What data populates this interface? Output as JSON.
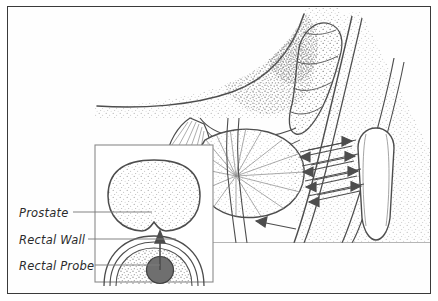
{
  "figure": {
    "kind": "medical-illustration",
    "background_color": "#ffffff",
    "border_color": "#3a3a3a",
    "ink_color": "#4a4a4a",
    "stipple_color": "#8c8c8c",
    "probe_fill_color": "#6f6f6f",
    "leader_color": "#7d7d7d"
  },
  "labels": {
    "prostate": "Prostate",
    "rectal_wall": "Rectal Wall",
    "rectal_probe": "Rectal Probe"
  },
  "inset": {
    "name": "cross-section-inset",
    "contents": [
      "prostate-cross-section",
      "rectal-wall-arcs",
      "rectal-probe-circle",
      "direction-arrow"
    ]
  },
  "main_view": {
    "name": "sagittal-anatomy-view",
    "structures": [
      "bladder",
      "seminal-vesicle",
      "prostate",
      "urethra",
      "rectum",
      "ultrasound-probe"
    ],
    "wave_arrows": {
      "count": 8,
      "description": "bidirectional ultrasound beam arrows"
    }
  }
}
